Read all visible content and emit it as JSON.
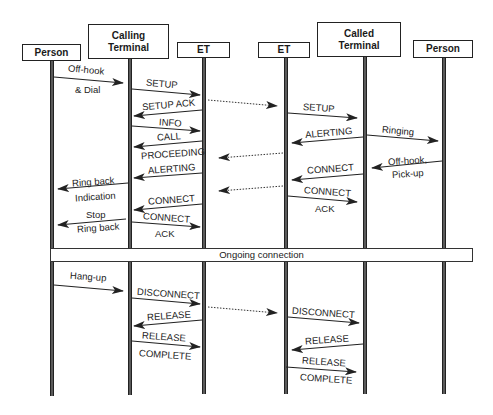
{
  "diagram": {
    "type": "sequence",
    "participants": [
      {
        "id": "person-calling",
        "label": "Person"
      },
      {
        "id": "calling-terminal",
        "label": "Calling\nTerminal",
        "line1": "Calling",
        "line2": "Terminal"
      },
      {
        "id": "et-calling",
        "label": "ET"
      },
      {
        "id": "et-called",
        "label": "ET"
      },
      {
        "id": "called-terminal",
        "label": "Called\nTerminal",
        "line1": "Called",
        "line2": "Terminal"
      },
      {
        "id": "person-called",
        "label": "Person"
      }
    ],
    "messages": [
      {
        "from": "person-calling",
        "to": "calling-terminal",
        "line1": "Off-hook",
        "line2": "& Dial"
      },
      {
        "from": "calling-terminal",
        "to": "et-calling",
        "line1": "SETUP"
      },
      {
        "from": "et-calling",
        "to": "calling-terminal",
        "line1": "SETUP ACK"
      },
      {
        "from": "et-calling",
        "to": "et-called",
        "style": "dotted",
        "line1": ""
      },
      {
        "from": "et-called",
        "to": "called-terminal",
        "line1": "SETUP"
      },
      {
        "from": "calling-terminal",
        "to": "et-calling",
        "line1": "INFO"
      },
      {
        "from": "called-terminal",
        "to": "et-called",
        "line1": "ALERTING"
      },
      {
        "from": "called-terminal",
        "to": "person-called",
        "line1": "Ringing"
      },
      {
        "from": "et-calling",
        "to": "calling-terminal",
        "line1": "CALL",
        "line2": "PROCEEDING"
      },
      {
        "from": "et-called",
        "to": "et-calling",
        "style": "dotted",
        "line1": ""
      },
      {
        "from": "person-called",
        "to": "called-terminal",
        "line1": "Off-hook,",
        "line2": "Pick-up"
      },
      {
        "from": "et-calling",
        "to": "calling-terminal",
        "line1": "ALERTING"
      },
      {
        "from": "calling-terminal",
        "to": "person-calling",
        "line1": "Ring back",
        "line2": "Indication"
      },
      {
        "from": "called-terminal",
        "to": "et-called",
        "line1": "CONNECT"
      },
      {
        "from": "et-called",
        "to": "et-calling",
        "style": "dotted",
        "line1": ""
      },
      {
        "from": "et-called",
        "to": "called-terminal",
        "line1": "CONNECT",
        "line2": "ACK"
      },
      {
        "from": "et-calling",
        "to": "calling-terminal",
        "line1": "CONNECT"
      },
      {
        "from": "calling-terminal",
        "to": "person-calling",
        "line1": "Stop",
        "line2": "Ring back"
      },
      {
        "from": "calling-terminal",
        "to": "et-calling",
        "line1": "CONNECT",
        "line2": "ACK"
      },
      {
        "from": "person-calling",
        "to": "calling-terminal",
        "line1": "Hang-up"
      },
      {
        "from": "calling-terminal",
        "to": "et-calling",
        "line1": "DISCONNECT"
      },
      {
        "from": "et-calling",
        "to": "et-called",
        "style": "dotted",
        "line1": ""
      },
      {
        "from": "et-calling",
        "to": "calling-terminal",
        "line1": "RELEASE"
      },
      {
        "from": "et-called",
        "to": "called-terminal",
        "line1": "DISCONNECT"
      },
      {
        "from": "calling-terminal",
        "to": "et-calling",
        "line1": "RELEASE",
        "line2": "COMPLETE"
      },
      {
        "from": "called-terminal",
        "to": "et-called",
        "line1": "RELEASE"
      },
      {
        "from": "et-called",
        "to": "called-terminal",
        "line1": "RELEASE",
        "line2": "COMPLETE"
      }
    ],
    "ongoing_label": "Ongoing connection",
    "colors": {
      "line": "#222222",
      "lifeline": "#5a5a5a",
      "background": "#ffffff"
    }
  }
}
